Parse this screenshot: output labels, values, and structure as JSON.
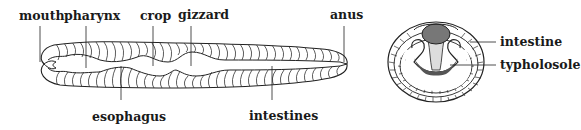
{
  "diagram": {
    "longitudinal_view": {
      "top_labels": [
        "mouth",
        "pharynx",
        "crop",
        "gizzard",
        "anus"
      ],
      "bottom_labels": [
        "esophagus",
        "intestines"
      ]
    },
    "cross_section": {
      "labels": [
        "intestine",
        "typholosole"
      ]
    },
    "colors": {
      "ink": "#222222",
      "background": "#ffffff",
      "fill_dark": "#777777"
    }
  }
}
